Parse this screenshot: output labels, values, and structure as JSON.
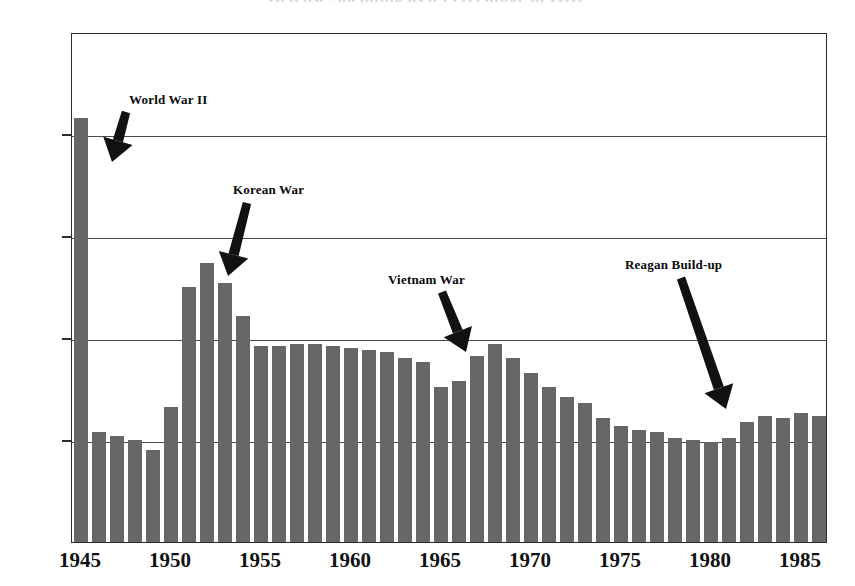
{
  "chart_data": {
    "type": "bar",
    "title": "Defense Spending as a Percentage of GDP",
    "xlabel": "",
    "ylabel": "",
    "ylim": [
      0,
      25
    ],
    "xlim": [
      1945,
      1987
    ],
    "grid": true,
    "legend": "none",
    "bar_color": "#676767",
    "y_ticks": [
      "0%",
      "5%",
      "10%",
      "15%",
      "20%",
      "25%"
    ],
    "y_tick_values": [
      0,
      5,
      10,
      15,
      20,
      25
    ],
    "x_ticks": [
      "1945",
      "1950",
      "1955",
      "1960",
      "1965",
      "1970",
      "1975",
      "1980",
      "1985"
    ],
    "x_tick_values": [
      1945,
      1950,
      1955,
      1960,
      1965,
      1970,
      1975,
      1980,
      1985
    ],
    "categories": [
      1945,
      1946,
      1947,
      1948,
      1949,
      1950,
      1951,
      1952,
      1953,
      1954,
      1955,
      1956,
      1957,
      1958,
      1959,
      1960,
      1961,
      1962,
      1963,
      1964,
      1965,
      1966,
      1967,
      1968,
      1969,
      1970,
      1971,
      1972,
      1973,
      1974,
      1975,
      1976,
      1977,
      1978,
      1979,
      1980,
      1981,
      1982,
      1983,
      1984,
      1985,
      1986
    ],
    "values": [
      20.8,
      5.4,
      5.2,
      5.0,
      4.5,
      6.6,
      12.5,
      13.7,
      12.7,
      11.1,
      9.6,
      9.6,
      9.7,
      9.7,
      9.6,
      9.5,
      9.4,
      9.3,
      9.0,
      8.8,
      7.6,
      7.9,
      9.1,
      9.7,
      9.0,
      8.3,
      7.6,
      7.1,
      6.8,
      6.1,
      5.7,
      5.5,
      5.4,
      5.1,
      5.0,
      4.9,
      5.1,
      5.9,
      6.2,
      6.1,
      6.3,
      6.2
    ],
    "annotations": [
      {
        "text": "World War II",
        "points_to_year": 1945
      },
      {
        "text": "Korean War",
        "points_to_year": 1953
      },
      {
        "text": "Vietnam War",
        "points_to_year": 1967
      },
      {
        "text": "Reagan Build-up",
        "points_to_year": 1981
      }
    ]
  }
}
